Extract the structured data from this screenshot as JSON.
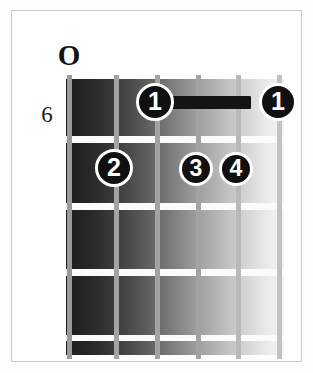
{
  "diagram": {
    "kind": "guitar-chord-diagram",
    "open_string_marker": "O",
    "fret_position_label": "6",
    "strings_count": 6,
    "frets_count": 5,
    "barre": {
      "finger": "1",
      "fret": 1,
      "from_string": 3,
      "to_string": 6,
      "color": "#141414"
    },
    "fingers": [
      {
        "label": "1",
        "string": 3,
        "fret": 1
      },
      {
        "label": "1",
        "string": 6,
        "fret": 1
      },
      {
        "label": "2",
        "string": 2,
        "fret": 2
      },
      {
        "label": "3",
        "string": 4,
        "fret": 2
      },
      {
        "label": "4",
        "string": 5,
        "fret": 2
      }
    ],
    "colors": {
      "dot_fill": "#101010",
      "dot_text": "#ffffff",
      "dot_outline": "#ffffff",
      "fret_line": "#fbfbfb",
      "string_line": "#a3a3a3",
      "board_dark": "#1e1e1e",
      "board_light": "#f4f4f4",
      "frame_border": "#c9c9c9",
      "background": "#fefefe"
    }
  }
}
